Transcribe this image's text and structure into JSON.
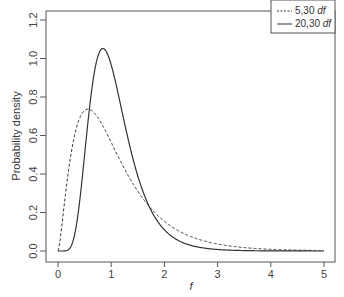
{
  "chart_data": {
    "type": "line",
    "title": "",
    "xlabel": "f",
    "ylabel": "Probability density",
    "xlim": [
      0,
      5
    ],
    "ylim": [
      0,
      1.2
    ],
    "xticks": [
      "0",
      "1",
      "2",
      "3",
      "4",
      "5"
    ],
    "yticks": [
      "0.0",
      "0.2",
      "0.4",
      "0.6",
      "0.8",
      "1.0",
      "1.2"
    ],
    "grid": false,
    "legend_position": "top-right",
    "x": [
      0,
      0.1,
      0.2,
      0.3,
      0.4,
      0.5,
      0.6,
      0.7,
      0.8,
      0.9,
      1.0,
      1.2,
      1.4,
      1.6,
      1.8,
      2.0,
      2.5,
      3.0,
      3.5,
      4.0,
      4.5,
      5.0
    ],
    "series": [
      {
        "name": "5,30 df",
        "style": "dashed",
        "df1": 5,
        "df2": 30,
        "values": [
          0.0,
          0.28,
          0.5,
          0.64,
          0.72,
          0.74,
          0.73,
          0.69,
          0.64,
          0.58,
          0.52,
          0.41,
          0.31,
          0.23,
          0.17,
          0.13,
          0.06,
          0.03,
          0.015,
          0.008,
          0.004,
          0.002
        ]
      },
      {
        "name": "20,30 df",
        "style": "solid",
        "df1": 20,
        "df2": 30,
        "values": [
          0.0,
          0.0,
          0.005,
          0.05,
          0.21,
          0.46,
          0.73,
          0.93,
          1.04,
          1.05,
          0.98,
          0.75,
          0.5,
          0.31,
          0.18,
          0.1,
          0.025,
          0.006,
          0.002,
          0.0005,
          0.0001,
          0.0
        ]
      }
    ]
  },
  "legend": {
    "items": [
      {
        "label": "5,30",
        "suffix": "df",
        "style": "dashed"
      },
      {
        "label": "20,30",
        "suffix": "df",
        "style": "solid"
      }
    ]
  },
  "axes": {
    "xlabel": "f",
    "ylabel": "Probability density"
  }
}
